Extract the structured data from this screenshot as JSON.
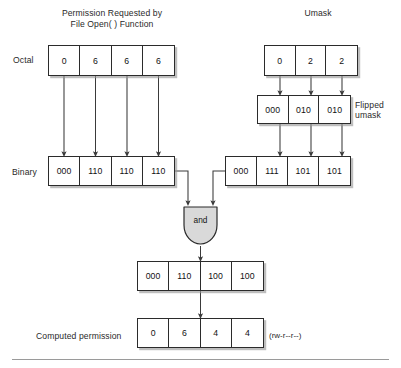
{
  "figure": {
    "kind": "umask-permission-computation-diagram",
    "divider": true,
    "colors": {
      "box_border": "#2b2b2b",
      "box_fill": "#ffffff",
      "shadow": "#969696",
      "gate_fill": "#d9d9d9",
      "arrow": "#3a3a3a",
      "text": "#1a1a1a",
      "divider": "#9a9a9a"
    }
  },
  "titles": {
    "left": "Permission Requested by\nFile Open( ) Function",
    "right": "Umask"
  },
  "labels": {
    "octal": "Octal",
    "binary": "Binary",
    "flipped_umask": "Flipped\numask",
    "computed_permission": "Computed permission",
    "symbolic_permission": "(rw-r--r--)",
    "and_gate": "and"
  },
  "rows": {
    "left_octal": {
      "name": "Permission Requested by File Open( ) Function - Octal",
      "cells": [
        "0",
        "6",
        "6",
        "6"
      ]
    },
    "left_binary": {
      "name": "Permission Requested by File Open( ) Function - Binary",
      "cells": [
        "000",
        "110",
        "110",
        "110"
      ]
    },
    "umask_octal": {
      "name": "Umask - Octal",
      "cells": [
        "0",
        "2",
        "2"
      ]
    },
    "flipped_umask": {
      "name": "Flipped umask - Binary",
      "cells": [
        "000",
        "010",
        "010"
      ]
    },
    "right_binary": {
      "name": "Umask complement - Binary",
      "cells": [
        "000",
        "111",
        "101",
        "101"
      ]
    },
    "and_result": {
      "name": "AND result - Binary",
      "cells": [
        "000",
        "110",
        "100",
        "100"
      ]
    },
    "computed_octal": {
      "name": "Computed permission - Octal",
      "cells": [
        "0",
        "6",
        "4",
        "4"
      ]
    }
  }
}
